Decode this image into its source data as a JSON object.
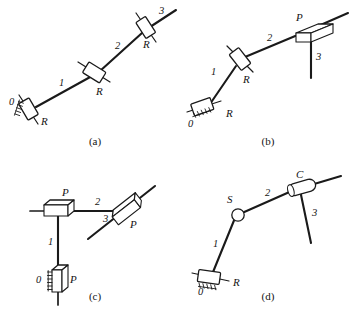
{
  "figure": {
    "width": 355,
    "height": 318,
    "background": "#ffffff",
    "ink_color": "#1a1a1a"
  },
  "legend": {
    "joint_types": [
      {
        "code": "R",
        "name": "revolute-joint"
      },
      {
        "code": "P",
        "name": "prismatic-joint"
      },
      {
        "code": "S",
        "name": "spherical-joint"
      },
      {
        "code": "C",
        "name": "cylindrical-joint"
      }
    ],
    "link_numbering": [
      "0",
      "1",
      "2",
      "3"
    ]
  },
  "panels": [
    {
      "id": "a",
      "caption": "(a)",
      "chain": "R-R-R",
      "ground_label": "0",
      "links": [
        {
          "number": "1"
        },
        {
          "number": "2"
        },
        {
          "number": "3"
        }
      ],
      "joints": [
        {
          "code": "R",
          "role": "ground-joint"
        },
        {
          "code": "R",
          "role": "middle-joint"
        },
        {
          "code": "R",
          "role": "distal-joint"
        }
      ]
    },
    {
      "id": "b",
      "caption": "(b)",
      "chain": "R-R-P",
      "ground_label": "0",
      "links": [
        {
          "number": "1"
        },
        {
          "number": "2"
        },
        {
          "number": "3"
        }
      ],
      "joints": [
        {
          "code": "R",
          "role": "ground-joint"
        },
        {
          "code": "R",
          "role": "middle-joint"
        },
        {
          "code": "P",
          "role": "distal-joint"
        }
      ]
    },
    {
      "id": "c",
      "caption": "(c)",
      "chain": "P-P-P",
      "ground_label": "0",
      "links": [
        {
          "number": "1"
        },
        {
          "number": "2"
        },
        {
          "number": "3"
        }
      ],
      "joints": [
        {
          "code": "P",
          "role": "ground-joint"
        },
        {
          "code": "P",
          "role": "middle-joint"
        },
        {
          "code": "P",
          "role": "distal-joint"
        }
      ]
    },
    {
      "id": "d",
      "caption": "(d)",
      "chain": "R-S-C",
      "ground_label": "0",
      "links": [
        {
          "number": "1"
        },
        {
          "number": "2"
        },
        {
          "number": "3"
        }
      ],
      "joints": [
        {
          "code": "R",
          "role": "ground-joint"
        },
        {
          "code": "S",
          "role": "middle-joint"
        },
        {
          "code": "C",
          "role": "distal-joint"
        }
      ]
    }
  ]
}
